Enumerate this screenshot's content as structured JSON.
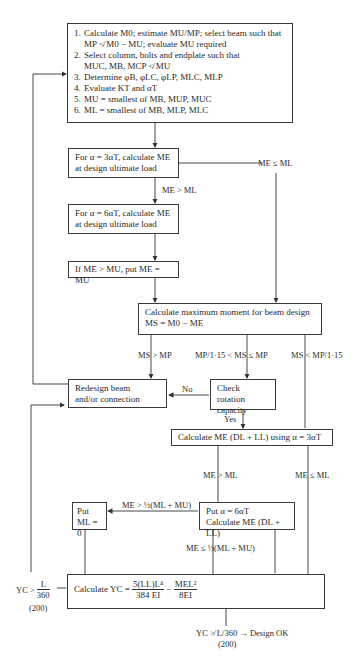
{
  "flowchart": {
    "start_box": {
      "steps": [
        {
          "num": "1.",
          "line1": "Calculate M0; estimate MU/MP; select beam such that",
          "line2": "MP ≮ M0 − MU; evaluate MU required"
        },
        {
          "num": "2.",
          "line1": "Select column, bolts and endplate such that",
          "line2": "MUC, MB, MCP ≮ MU"
        },
        {
          "num": "3.",
          "line1": "Determine φB, φLC, φLP, MLC, MLP"
        },
        {
          "num": "4.",
          "line1": "Evaluate KT and αT"
        },
        {
          "num": "5.",
          "line1": "MU = smallest of MB, MUP, MUC"
        },
        {
          "num": "6.",
          "line1": "ML = smallest of MB, MLP, MLC"
        }
      ]
    },
    "box_alpha3": {
      "line1": "For α = 3αT, calculate ME",
      "line2": "at design ultimate load"
    },
    "box_alpha6": {
      "line1": "For α = 6αT, calculate ME",
      "line2": "at design ultimate load"
    },
    "box_if_me": {
      "text": "If ME > MU, put ME = MU"
    },
    "box_max_moment": {
      "line1": "Calculate maximum moment for beam design",
      "line2": "MS = M0 − ME"
    },
    "box_redesign": {
      "line1": "Redesign beam",
      "line2": "and/or connection"
    },
    "box_check_rotation": {
      "line1": "Check rotation",
      "line2": "capacity"
    },
    "box_calc_me_dl": {
      "text": "Calculate ME (DL + LL) using α = 3αT"
    },
    "box_put_ml0": {
      "line1": "Put",
      "line2": "ML = 0"
    },
    "box_put_alpha6": {
      "line1": "Put α = 6αT",
      "line2": "Calculate ME (DL + LL)"
    },
    "box_calc_yc": {
      "prefix": "Calculate YC =",
      "term1_num": "5(LL)L⁴",
      "term1_den": "384 EI",
      "minus": "−",
      "term2_num": "MEL²",
      "term2_den": "8EI"
    },
    "labels": {
      "me_gt_ml_1": "ME > ML",
      "me_le_ml_1": "ME ≤ ML",
      "ms_gt_mp": "MS > MP",
      "ms_mid": "MP/1·15 < MS ≤ MP",
      "ms_lt": "MS < MP/1·15",
      "no": "No",
      "yes": "Yes",
      "me_gt_ml_2": "ME > ML",
      "me_le_ml_2": "ME ≤ ML",
      "me_gt_half": "ME > ½(ML + MU)",
      "me_le_half": "ME ≤ ½(ML + MU)",
      "yc_gt_prefix": "YC >",
      "yc_gt_num": "L",
      "yc_gt_den": "360",
      "yc_gt_alt": "(200)",
      "design_ok": "YC ≯ L/360 → Design OK",
      "design_ok_alt": "(200)"
    }
  }
}
